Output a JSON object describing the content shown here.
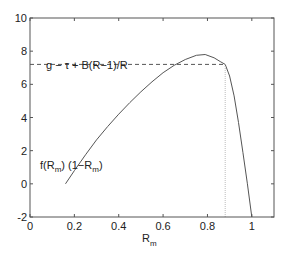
{
  "chart_data": {
    "type": "line",
    "title": "",
    "xlabel": "R_m",
    "ylabel": "",
    "xlim": [
      0,
      1.1
    ],
    "ylim": [
      -2,
      10
    ],
    "grid": false,
    "legend": null,
    "x_ticks": [
      0,
      0.2,
      0.4,
      0.6,
      0.8,
      1
    ],
    "x_tick_labels": [
      "0",
      "0.2",
      "0.4",
      "0.6",
      "0.8",
      "1"
    ],
    "y_ticks": [
      -2,
      0,
      2,
      4,
      6,
      8,
      10
    ],
    "y_tick_labels": [
      "-2",
      "0",
      "2",
      "4",
      "6",
      "8",
      "10"
    ],
    "series": [
      {
        "name": "f(R_m) (1-R_m)",
        "style": "solid",
        "x": [
          0.16,
          0.2,
          0.25,
          0.3,
          0.35,
          0.4,
          0.45,
          0.5,
          0.55,
          0.6,
          0.65,
          0.7,
          0.75,
          0.79,
          0.83,
          0.86,
          0.88,
          0.9,
          0.92,
          0.94,
          0.96,
          0.98,
          1.0
        ],
        "y": [
          0.0,
          0.8,
          1.75,
          2.65,
          3.45,
          4.2,
          4.9,
          5.55,
          6.15,
          6.7,
          7.15,
          7.5,
          7.75,
          7.8,
          7.6,
          7.35,
          7.2,
          6.5,
          5.3,
          3.7,
          1.9,
          0.0,
          -2.0
        ]
      },
      {
        "name": "g - τ + B(R-1)/R",
        "style": "dashed",
        "x": [
          0,
          0.88
        ],
        "y": [
          7.2,
          7.2
        ]
      },
      {
        "name": "vertical-marker",
        "style": "dotted",
        "x": [
          0.88,
          0.88
        ],
        "y": [
          -2,
          7.2
        ]
      }
    ],
    "annotations": [
      {
        "text": "g − τ + B(R−1)/R",
        "x": 0.07,
        "y": 7.7
      },
      {
        "text": "f(R_m) (1−R_m)",
        "x": 0.05,
        "y": 2.6
      }
    ]
  },
  "labels": {
    "xlabel_main": "R",
    "xlabel_sub": "m",
    "dashed_annotation": "g − τ + B(R−1)/R",
    "curve_annot_f": "f(R",
    "curve_annot_sub1": "m",
    "curve_annot_mid": ") (1−R",
    "curve_annot_sub2": "m",
    "curve_annot_end": ")"
  }
}
